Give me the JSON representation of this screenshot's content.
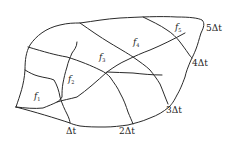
{
  "diagram": {
    "type": "watershed isochrone (time-area) diagram",
    "colors": {
      "line": "#2a2a2a",
      "text": "#222222",
      "background": "#ffffff"
    },
    "subareas": [
      {
        "id": "f1",
        "base": "f",
        "sub": "1"
      },
      {
        "id": "f2",
        "base": "f",
        "sub": "2"
      },
      {
        "id": "f3",
        "base": "f",
        "sub": "3"
      },
      {
        "id": "f4",
        "base": "f",
        "sub": "4"
      },
      {
        "id": "f5",
        "base": "f",
        "sub": "5"
      }
    ],
    "isochrones": [
      {
        "id": "dt1",
        "label": "Δt"
      },
      {
        "id": "dt2",
        "label": "2Δt"
      },
      {
        "id": "dt3",
        "label": "3Δt"
      },
      {
        "id": "dt4",
        "label": "4Δt"
      },
      {
        "id": "dt5",
        "label": "5Δt"
      }
    ]
  }
}
